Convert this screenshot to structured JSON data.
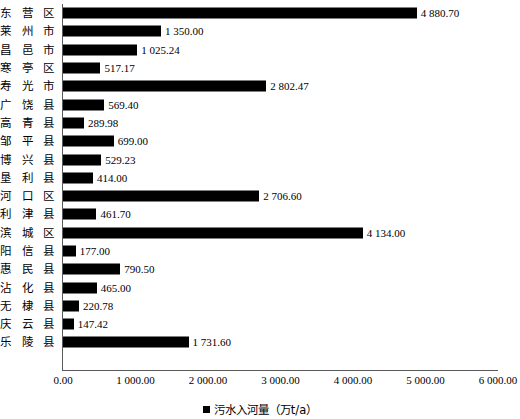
{
  "chart_data": {
    "type": "bar",
    "orientation": "horizontal",
    "title": "",
    "xlabel": "",
    "ylabel": "",
    "xlim": [
      0,
      6000
    ],
    "grid": false,
    "legend_position": "bottom",
    "legend": [
      "污水入河量（万t/a）"
    ],
    "series_name": "污水入河量（万t/a）",
    "bar_color": "#000000",
    "xticks": [
      0,
      1000,
      2000,
      3000,
      4000,
      5000,
      6000
    ],
    "xtick_labels": [
      "0.00",
      "1 000.00",
      "2 000.00",
      "3 000.00",
      "4 000.00",
      "5 000.00",
      "6 000.00"
    ],
    "categories": [
      "东营区",
      "莱州市",
      "昌邑市",
      "寒亭区",
      "寿光市",
      "广饶县",
      "高青县",
      "邹平县",
      "博兴县",
      "垦利县",
      "河口区",
      "利津县",
      "滨城区",
      "阳信县",
      "惠民县",
      "沾化县",
      "无棣县",
      "庆云县",
      "乐陵县"
    ],
    "values": [
      4880.7,
      1350.0,
      1025.24,
      517.17,
      2802.47,
      569.4,
      289.98,
      699.0,
      529.23,
      414.0,
      2706.6,
      461.7,
      4134.0,
      177.0,
      790.5,
      465.0,
      220.78,
      147.42,
      1731.6
    ],
    "value_labels": [
      "4 880.70",
      "1 350.00",
      "1 025.24",
      "517.17",
      "2 802.47",
      "569.40",
      "289.98",
      "699.00",
      "529.23",
      "414.00",
      "2 706.60",
      "461.70",
      "4 134.00",
      "177.00",
      "790.50",
      "465.00",
      "220.78",
      "147.42",
      "1 731.60"
    ]
  },
  "legend": {
    "swatch_name": "legend-color-swatch",
    "label": "污水入河量（万t/a）"
  }
}
